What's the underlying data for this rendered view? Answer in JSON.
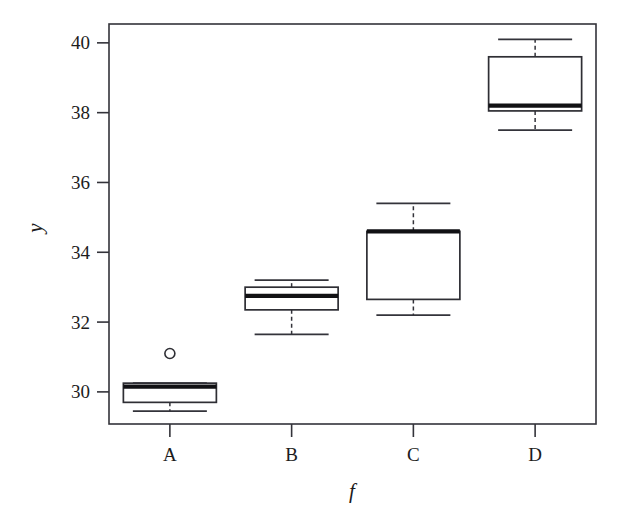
{
  "chart_data": {
    "type": "box",
    "title": "",
    "xlabel": "f",
    "ylabel": "y",
    "grid": false,
    "legend": "none",
    "categories": [
      "A",
      "B",
      "C",
      "D"
    ],
    "ylim": [
      29.08,
      40.54
    ],
    "yticks": [
      30,
      32,
      34,
      36,
      38,
      40
    ],
    "ytick_labels": [
      "30",
      "32",
      "34",
      "36",
      "38",
      "40"
    ],
    "boxes": [
      {
        "category": "A",
        "whisker_low": 29.45,
        "q1": 29.7,
        "median": 30.15,
        "q3": 30.25,
        "whisker_high": 30.25,
        "outliers": [
          31.1
        ]
      },
      {
        "category": "B",
        "whisker_low": 31.65,
        "q1": 32.35,
        "median": 32.75,
        "q3": 33.0,
        "whisker_high": 33.2,
        "outliers": []
      },
      {
        "category": "C",
        "whisker_low": 32.2,
        "q1": 32.65,
        "median": 34.6,
        "q3": 34.6,
        "whisker_high": 35.4,
        "outliers": []
      },
      {
        "category": "D",
        "whisker_low": 37.5,
        "q1": 38.05,
        "median": 38.2,
        "q3": 39.6,
        "whisker_high": 40.1,
        "outliers": []
      }
    ]
  },
  "axes": {
    "y_axis_title": "y",
    "x_axis_title": "f"
  },
  "colors": {
    "background": "#ffffff",
    "frame": "#33333a",
    "box_stroke": "#2e2e34",
    "median": "#111114",
    "text": "#1c1c1c"
  }
}
